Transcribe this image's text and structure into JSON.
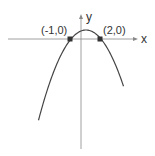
{
  "diagram": {
    "type": "parabola-graph",
    "axes": {
      "x_label": "x",
      "y_label": "y"
    },
    "curve": {
      "shape": "downward-opening parabola",
      "color": "#444444"
    },
    "points": [
      {
        "label": "(-1,0)",
        "x": -1,
        "y": 0
      },
      {
        "label": "(2,0)",
        "x": 2,
        "y": 0
      }
    ],
    "colors": {
      "axis": "#888888",
      "curve": "#444444",
      "point": "#333333",
      "text": "#333333"
    }
  }
}
